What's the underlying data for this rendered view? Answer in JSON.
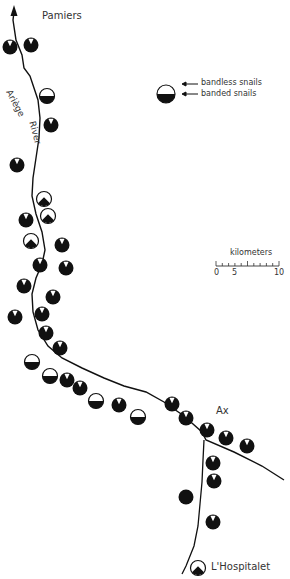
{
  "towns": [
    {
      "name": "Pamiers",
      "x": 42,
      "y": 10
    },
    {
      "name": "Ax",
      "x": 216,
      "y": 412
    },
    {
      "name": "L'Hospitalet",
      "x": 210,
      "y": 564
    }
  ],
  "river_label": {
    "word1": "Ariège",
    "word2": "River"
  },
  "legend": {
    "bandless": "bandless snails",
    "banded": "banded snails"
  },
  "scale": {
    "title": "kilometers",
    "ticks": [
      "0",
      "5",
      "10"
    ]
  },
  "sites": [
    {
      "x": 10,
      "y": 47,
      "type": "wedge"
    },
    {
      "x": 31,
      "y": 45,
      "type": "wedge"
    },
    {
      "x": 47,
      "y": 96,
      "type": "half"
    },
    {
      "x": 51,
      "y": 125,
      "type": "wedge"
    },
    {
      "x": 17,
      "y": 165,
      "type": "wedge"
    },
    {
      "x": 44,
      "y": 199,
      "type": "mound"
    },
    {
      "x": 48,
      "y": 216,
      "type": "mound"
    },
    {
      "x": 26,
      "y": 220,
      "type": "wedge"
    },
    {
      "x": 31,
      "y": 241,
      "type": "mound"
    },
    {
      "x": 62,
      "y": 245,
      "type": "wedge"
    },
    {
      "x": 40,
      "y": 265,
      "type": "wedge"
    },
    {
      "x": 66,
      "y": 268,
      "type": "wedge"
    },
    {
      "x": 24,
      "y": 286,
      "type": "wedge"
    },
    {
      "x": 53,
      "y": 297,
      "type": "wedge"
    },
    {
      "x": 15,
      "y": 317,
      "type": "wedge"
    },
    {
      "x": 42,
      "y": 314,
      "type": "wedge"
    },
    {
      "x": 46,
      "y": 333,
      "type": "wedge"
    },
    {
      "x": 60,
      "y": 348,
      "type": "wedge"
    },
    {
      "x": 32,
      "y": 362,
      "type": "half"
    },
    {
      "x": 50,
      "y": 376,
      "type": "half"
    },
    {
      "x": 67,
      "y": 380,
      "type": "wedge"
    },
    {
      "x": 80,
      "y": 388,
      "type": "wedge"
    },
    {
      "x": 96,
      "y": 401,
      "type": "half"
    },
    {
      "x": 119,
      "y": 405,
      "type": "wedge"
    },
    {
      "x": 138,
      "y": 417,
      "type": "half"
    },
    {
      "x": 172,
      "y": 404,
      "type": "wedge"
    },
    {
      "x": 186,
      "y": 418,
      "type": "wedge"
    },
    {
      "x": 207,
      "y": 430,
      "type": "wedge"
    },
    {
      "x": 226,
      "y": 438,
      "type": "wedge"
    },
    {
      "x": 247,
      "y": 446,
      "type": "wedge"
    },
    {
      "x": 213,
      "y": 463,
      "type": "wedge"
    },
    {
      "x": 214,
      "y": 481,
      "type": "wedge"
    },
    {
      "x": 186,
      "y": 497,
      "type": "full"
    },
    {
      "x": 213,
      "y": 522,
      "type": "wedge"
    },
    {
      "x": 198,
      "y": 568,
      "type": "mound"
    }
  ],
  "legend_symbol": {
    "x": 166,
    "y": 94,
    "type": "half"
  }
}
